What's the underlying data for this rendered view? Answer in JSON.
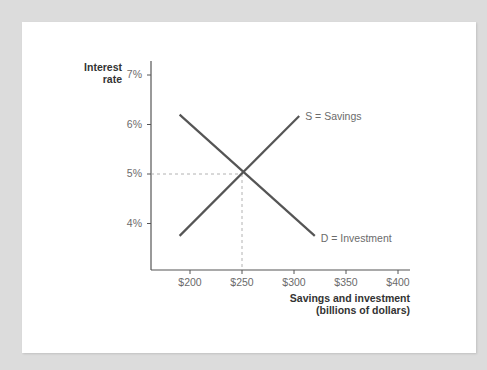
{
  "chart_data": {
    "type": "line",
    "title": "",
    "xlabel": "Savings and investment (billions of dollars)",
    "xlabel_lines": [
      "Savings and investment",
      "(billions of dollars)"
    ],
    "ylabel": "Interest rate",
    "ylabel_lines": [
      "Interest",
      "rate"
    ],
    "x_ticks": [
      "$200",
      "$250",
      "$300",
      "$350",
      "$400"
    ],
    "x_tick_values": [
      200,
      250,
      300,
      350,
      400
    ],
    "y_ticks": [
      "4%",
      "5%",
      "6%",
      "7%"
    ],
    "y_tick_values": [
      4,
      5,
      6,
      7
    ],
    "xlim": [
      155,
      415
    ],
    "ylim": [
      3.1,
      7.3
    ],
    "grid": false,
    "legend": "inline labels at line ends",
    "series": [
      {
        "name": "S = Savings",
        "label": "S = Savings",
        "x": [
          190,
          305
        ],
        "y": [
          3.75,
          6.17
        ],
        "color": "#555555"
      },
      {
        "name": "D = Investment",
        "label": "D = Investment",
        "x": [
          190,
          320
        ],
        "y": [
          6.2,
          3.75
        ],
        "color": "#555555"
      }
    ],
    "annotations": [
      {
        "type": "equilibrium",
        "x": 250,
        "y": 5,
        "style": "dashed guide lines to both axes"
      }
    ]
  },
  "colors": {
    "background": "#dcdcdc",
    "panel": "#ffffff",
    "line": "#555555",
    "axis": "#555555",
    "dash": "#a0a0a0",
    "tick_text": "#6b6b6b",
    "title_text": "#333333"
  }
}
